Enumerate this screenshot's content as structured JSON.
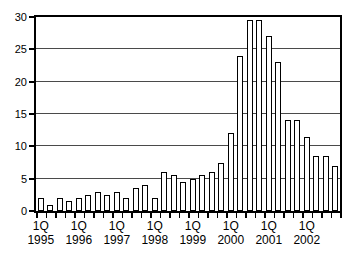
{
  "chart_data": {
    "type": "bar",
    "title": "",
    "subtitle": "",
    "xlabel": "",
    "ylabel": "",
    "ylim": [
      0,
      30
    ],
    "yticks": [
      0,
      5,
      10,
      15,
      20,
      25,
      30
    ],
    "ytick_labels": [
      "0",
      "5",
      "10",
      "15",
      "20",
      "25",
      "30"
    ],
    "grid": true,
    "legend": false,
    "legend_position": "none",
    "bar_fill_color": "#ffffff",
    "bar_edge_color": "#000000",
    "axis_color": "#000000",
    "grid_color": "#4a4a4a",
    "x_group_labels": [
      {
        "quarter": "1Q",
        "year": "1995"
      },
      {
        "quarter": "1Q",
        "year": "1996"
      },
      {
        "quarter": "1Q",
        "year": "1997"
      },
      {
        "quarter": "1Q",
        "year": "1998"
      },
      {
        "quarter": "1Q",
        "year": "1999"
      },
      {
        "quarter": "1Q",
        "year": "2000"
      },
      {
        "quarter": "1Q",
        "year": "2001"
      },
      {
        "quarter": "1Q",
        "year": "2002"
      }
    ],
    "categories": [
      "1Q 1995",
      "2Q 1995",
      "3Q 1995",
      "4Q 1995",
      "1Q 1996",
      "2Q 1996",
      "3Q 1996",
      "4Q 1996",
      "1Q 1997",
      "2Q 1997",
      "3Q 1997",
      "4Q 1997",
      "1Q 1998",
      "2Q 1998",
      "3Q 1998",
      "4Q 1998",
      "1Q 1999",
      "2Q 1999",
      "3Q 1999",
      "4Q 1999",
      "1Q 2000",
      "2Q 2000",
      "3Q 2000",
      "4Q 2000",
      "1Q 2001",
      "2Q 2001",
      "3Q 2001",
      "4Q 2001",
      "1Q 2002",
      "2Q 2002",
      "3Q 2002",
      "4Q 2002"
    ],
    "values": [
      2.0,
      1.0,
      2.0,
      1.5,
      2.0,
      2.5,
      3.0,
      2.5,
      3.0,
      2.0,
      3.5,
      4.0,
      2.0,
      6.0,
      5.5,
      4.5,
      5.0,
      5.5,
      6.0,
      7.5,
      12.0,
      24.0,
      29.5,
      29.5,
      27.0,
      23.0,
      14.0,
      14.0,
      11.5,
      8.5,
      8.5,
      7.0
    ]
  }
}
